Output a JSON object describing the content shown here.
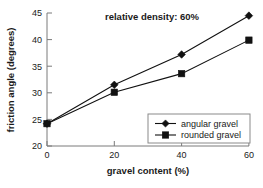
{
  "chart_data": {
    "type": "line",
    "title": "relative density: 60%",
    "xlabel": "gravel content (%)",
    "ylabel": "friction angle (degrees)",
    "x": [
      0,
      20,
      40,
      60
    ],
    "xlim": [
      0,
      60
    ],
    "ylim": [
      20,
      45
    ],
    "xticks": [
      "0",
      "20",
      "40",
      "60"
    ],
    "yticks": [
      "20",
      "25",
      "30",
      "35",
      "40",
      "45"
    ],
    "grid": false,
    "legend_position": "lower right",
    "series": [
      {
        "name": "angular gravel",
        "marker": "diamond",
        "color": "#111111",
        "values": [
          24.2,
          31.5,
          37.2,
          44.5
        ]
      },
      {
        "name": "rounded gravel",
        "marker": "square",
        "color": "#111111",
        "values": [
          24.2,
          30.1,
          33.6,
          39.9
        ]
      }
    ]
  },
  "legend": {
    "entries": [
      {
        "label": "angular gravel"
      },
      {
        "label": "rounded gravel"
      }
    ]
  }
}
